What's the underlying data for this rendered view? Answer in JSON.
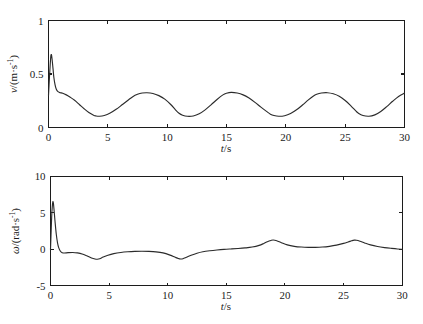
{
  "figure": {
    "background_color": "#ffffff",
    "curve_color": "#2b2b2b",
    "axis_color": "#1c1c1c"
  },
  "panels": {
    "top": {
      "name": "velocity-plot",
      "xlabel_italic": "t",
      "xlabel_rest": "/s",
      "ylabel_italic": "v",
      "ylabel_rest": "/(m·s",
      "ylabel_sup": "-1",
      "ylabel_close": ")",
      "xticks": [
        "0",
        "5",
        "10",
        "15",
        "20",
        "25",
        "30"
      ],
      "yticks": [
        "0",
        "0.5",
        "1"
      ]
    },
    "bottom": {
      "name": "angular-velocity-plot",
      "xlabel_italic": "t",
      "xlabel_rest": "/s",
      "ylabel_italic": "ω",
      "ylabel_rest": "/(rad·s",
      "ylabel_sup": "-1",
      "ylabel_close": ")",
      "xticks": [
        "0",
        "5",
        "10",
        "15",
        "20",
        "25",
        "30"
      ],
      "yticks": [
        "-5",
        "0",
        "5",
        "10"
      ]
    }
  },
  "chart_data": [
    {
      "type": "line",
      "title": "",
      "xlabel": "t/s",
      "ylabel": "v/(m·s^-1)",
      "xlim": [
        0,
        30
      ],
      "ylim": [
        0,
        1
      ],
      "xticks": [
        0,
        5,
        10,
        15,
        20,
        25,
        30
      ],
      "yticks": [
        0,
        0.5,
        1
      ],
      "grid": false,
      "legend": null,
      "series": [
        {
          "name": "v",
          "x": [
            0,
            0.08,
            0.15,
            0.2,
            0.25,
            0.3,
            0.38,
            0.45,
            0.55,
            0.65,
            0.8,
            1.0,
            1.2,
            1.5,
            1.8,
            2.2,
            2.6,
            3.0,
            3.4,
            3.8,
            4.0,
            4.3,
            4.7,
            5.2,
            5.7,
            6.2,
            6.7,
            7.1,
            7.5,
            7.9,
            8.3,
            8.8,
            9.3,
            9.8,
            10.3,
            10.7,
            11.0,
            11.3,
            11.7,
            12.2,
            12.7,
            13.2,
            13.7,
            14.2,
            14.7,
            15.0,
            15.4,
            15.9,
            16.4,
            16.9,
            17.4,
            17.9,
            18.4,
            18.7,
            19.0,
            19.4,
            19.9,
            20.4,
            20.9,
            21.4,
            21.9,
            22.3,
            22.6,
            23.0,
            23.5,
            24.0,
            24.5,
            25.0,
            25.5,
            25.9,
            26.1,
            26.5,
            27.0,
            27.5,
            28.0,
            28.5,
            29.0,
            29.5,
            30.0
          ],
          "y": [
            0.3,
            0.47,
            0.6,
            0.67,
            0.68,
            0.64,
            0.55,
            0.47,
            0.4,
            0.36,
            0.335,
            0.325,
            0.32,
            0.305,
            0.285,
            0.255,
            0.215,
            0.175,
            0.14,
            0.115,
            0.108,
            0.105,
            0.112,
            0.135,
            0.17,
            0.212,
            0.255,
            0.288,
            0.31,
            0.322,
            0.325,
            0.318,
            0.298,
            0.265,
            0.215,
            0.165,
            0.133,
            0.115,
            0.105,
            0.108,
            0.128,
            0.165,
            0.212,
            0.262,
            0.305,
            0.32,
            0.328,
            0.322,
            0.305,
            0.275,
            0.235,
            0.19,
            0.148,
            0.125,
            0.112,
            0.105,
            0.11,
            0.13,
            0.165,
            0.21,
            0.258,
            0.292,
            0.31,
            0.322,
            0.325,
            0.315,
            0.292,
            0.252,
            0.2,
            0.155,
            0.135,
            0.112,
            0.105,
            0.118,
            0.15,
            0.195,
            0.245,
            0.29,
            0.322
          ]
        }
      ]
    },
    {
      "type": "line",
      "title": "",
      "xlabel": "t/s",
      "ylabel": "ω/(rad·s^-1)",
      "xlim": [
        0,
        30
      ],
      "ylim": [
        -5,
        10
      ],
      "xticks": [
        0,
        5,
        10,
        15,
        20,
        25,
        30
      ],
      "yticks": [
        -5,
        0,
        5,
        10
      ],
      "grid": false,
      "legend": null,
      "series": [
        {
          "name": "omega",
          "x": [
            0,
            0.05,
            0.1,
            0.15,
            0.2,
            0.25,
            0.32,
            0.4,
            0.5,
            0.6,
            0.7,
            0.85,
            1.0,
            1.2,
            1.5,
            1.9,
            2.3,
            2.7,
            3.1,
            3.5,
            3.8,
            4.0,
            4.2,
            4.5,
            4.9,
            5.4,
            6.0,
            6.6,
            7.2,
            7.8,
            8.4,
            9.0,
            9.6,
            10.2,
            10.6,
            10.9,
            11.1,
            11.3,
            11.6,
            12.0,
            12.5,
            13.0,
            13.6,
            14.2,
            14.8,
            15.4,
            16.0,
            16.6,
            17.2,
            17.8,
            18.2,
            18.5,
            18.8,
            19.0,
            19.3,
            19.7,
            20.2,
            20.8,
            21.4,
            22.0,
            22.6,
            23.2,
            23.8,
            24.4,
            25.0,
            25.4,
            25.7,
            25.9,
            26.1,
            26.4,
            26.8,
            27.3,
            27.9,
            28.5,
            29.1,
            29.6,
            30.0
          ],
          "y": [
            0.0,
            2.2,
            4.4,
            5.8,
            6.5,
            6.3,
            5.1,
            3.6,
            2.0,
            0.9,
            0.25,
            -0.25,
            -0.45,
            -0.5,
            -0.45,
            -0.42,
            -0.48,
            -0.62,
            -0.88,
            -1.18,
            -1.32,
            -1.35,
            -1.28,
            -1.05,
            -0.8,
            -0.58,
            -0.42,
            -0.33,
            -0.28,
            -0.26,
            -0.28,
            -0.34,
            -0.48,
            -0.78,
            -1.05,
            -1.25,
            -1.32,
            -1.28,
            -1.08,
            -0.8,
            -0.52,
            -0.32,
            -0.18,
            -0.08,
            0.0,
            0.06,
            0.12,
            0.2,
            0.32,
            0.55,
            0.82,
            1.05,
            1.22,
            1.28,
            1.18,
            0.92,
            0.62,
            0.42,
            0.32,
            0.28,
            0.28,
            0.32,
            0.42,
            0.58,
            0.82,
            1.02,
            1.18,
            1.26,
            1.25,
            1.12,
            0.88,
            0.62,
            0.4,
            0.25,
            0.14,
            0.06,
            0.02
          ]
        }
      ]
    }
  ]
}
